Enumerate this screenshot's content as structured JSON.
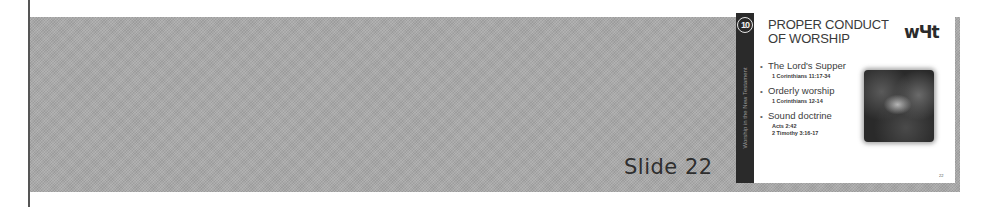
{
  "page": {
    "slide_label": "Slide 22"
  },
  "slide": {
    "badge_number": "10",
    "sidebar_text": "Worship in the New Testament",
    "title_line1": "PROPER CONDUCT",
    "title_line2": "OF WORSHIP",
    "logo_text": "wЧt",
    "bullets": [
      {
        "text": "The Lord's Supper",
        "refs": [
          "1 Corinthians 11:17-34"
        ]
      },
      {
        "text": "Orderly worship",
        "refs": [
          "1 Corinthians 12-14"
        ]
      },
      {
        "text": "Sound doctrine",
        "refs": [
          "Acts 2:42",
          "2 Timothy 3:16-17"
        ]
      }
    ],
    "bullet_glyph": "•",
    "image_alt": "Last Supper illustration",
    "page_number": "22"
  },
  "colors": {
    "panel_gray": "#a9a9a9",
    "sidebar_dark": "#2a2a2a",
    "text_dark": "#3a3a3a"
  }
}
